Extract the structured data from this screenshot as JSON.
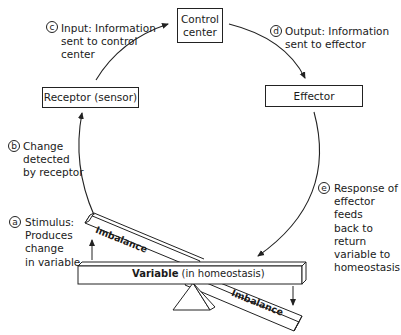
{
  "diagram": {
    "nodes": {
      "control_center": "Control center",
      "receptor": "Receptor (sensor)",
      "effector": "Effector"
    },
    "steps": [
      {
        "letter": "a",
        "text": "Stimulus: Produces change in variable",
        "lines": [
          "Stimulus:",
          "Produces",
          "change",
          "in variable"
        ]
      },
      {
        "letter": "b",
        "text": "Change detected by receptor",
        "lines": [
          "Change",
          "detected",
          "by receptor"
        ]
      },
      {
        "letter": "c",
        "text": "Input: Information sent to control center",
        "lines": [
          "Input: Information",
          "sent to control",
          "center"
        ]
      },
      {
        "letter": "d",
        "text": "Output: Information sent to effector",
        "lines": [
          "Output: Information",
          "sent to effector"
        ]
      },
      {
        "letter": "e",
        "text": "Response of effector feeds back to return variable to homeostasis",
        "lines": [
          "Response of",
          "effector feeds",
          "back to return",
          "variable to",
          "homeostasis"
        ]
      }
    ],
    "seesaw": {
      "variable_bold": "Variable",
      "variable_rest": " (in homeostasis)",
      "imbalance_left": "Imbalance",
      "imbalance_right": "Imbalance"
    },
    "colors": {
      "line": "#222222",
      "background": "#ffffff"
    }
  }
}
